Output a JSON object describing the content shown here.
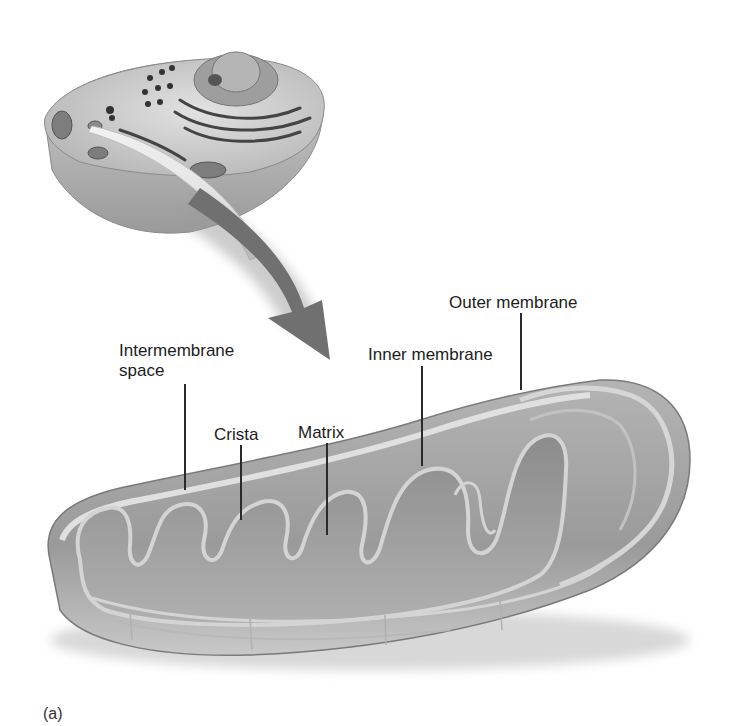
{
  "figure": {
    "panel_label": "(a)",
    "labels": {
      "outer_membrane": "Outer membrane",
      "inner_membrane": "Inner membrane",
      "intermembrane_space_line1": "Intermembrane",
      "intermembrane_space_line2": "space",
      "crista": "Crista",
      "matrix": "Matrix"
    },
    "colors": {
      "membrane_light": "#d9d9d9",
      "body_mid": "#a6a6a6",
      "body_dark": "#7a7a7a",
      "arrow": "#6e6e6e",
      "text": "#1c1c1c"
    }
  }
}
